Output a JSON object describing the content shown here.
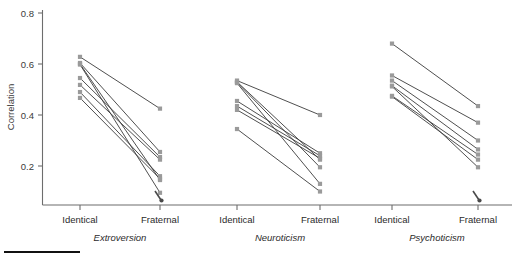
{
  "chart_data": {
    "type": "line",
    "title": "",
    "xlabel": "",
    "ylabel": "Correlation",
    "ylim": [
      0.0,
      0.8
    ],
    "yticks": [
      0.2,
      0.4,
      0.6,
      0.8
    ],
    "yticklabels": [
      "0.2",
      "0.4",
      "0.6",
      "0.8"
    ],
    "grid": false,
    "legend": "none",
    "x_categories": [
      "Identical",
      "Fraternal",
      "Identical",
      "Fraternal",
      "Identical",
      "Fraternal"
    ],
    "groups": [
      {
        "name": "Extroversion",
        "x": [
          "Identical",
          "Fraternal"
        ],
        "series": [
          {
            "name": "study-1",
            "values": [
              0.628,
              0.425
            ]
          },
          {
            "name": "study-2",
            "values": [
              0.604,
              0.255
            ]
          },
          {
            "name": "study-3",
            "values": [
              0.545,
              0.235
            ]
          },
          {
            "name": "study-4",
            "values": [
              0.518,
              0.225
            ]
          },
          {
            "name": "study-5",
            "values": [
              0.49,
              0.16
            ]
          },
          {
            "name": "study-6",
            "values": [
              0.467,
              0.15
            ]
          },
          {
            "name": "study-7",
            "values": [
              0.6,
              0.145
            ]
          },
          {
            "name": "study-8",
            "values": [
              0.598,
              0.095
            ]
          }
        ]
      },
      {
        "name": "Neuroticism",
        "x": [
          "Identical",
          "Fraternal"
        ],
        "series": [
          {
            "name": "study-1",
            "values": [
              0.535,
              0.4
            ]
          },
          {
            "name": "study-2",
            "values": [
              0.455,
              0.25
            ]
          },
          {
            "name": "study-3",
            "values": [
              0.435,
              0.24
            ]
          },
          {
            "name": "study-4",
            "values": [
              0.42,
              0.23
            ]
          },
          {
            "name": "study-5",
            "values": [
              0.53,
              0.225
            ]
          },
          {
            "name": "study-6",
            "values": [
              0.528,
              0.195
            ]
          },
          {
            "name": "study-7",
            "values": [
              0.525,
              0.13
            ]
          },
          {
            "name": "study-8",
            "values": [
              0.345,
              0.1
            ]
          }
        ]
      },
      {
        "name": "Psychoticism",
        "x": [
          "Identical",
          "Fraternal"
        ],
        "series": [
          {
            "name": "study-1",
            "values": [
              0.68,
              0.435
            ]
          },
          {
            "name": "study-2",
            "values": [
              0.555,
              0.37
            ]
          },
          {
            "name": "study-3",
            "values": [
              0.535,
              0.3
            ]
          },
          {
            "name": "study-4",
            "values": [
              0.515,
              0.265
            ]
          },
          {
            "name": "study-5",
            "values": [
              0.475,
              0.245
            ]
          },
          {
            "name": "study-6",
            "values": [
              0.472,
              0.225
            ]
          },
          {
            "name": "study-7",
            "values": [
              0.512,
              0.195
            ]
          }
        ]
      }
    ]
  },
  "axis": {
    "ylabel": "Correlation",
    "ytick_0": "0.2",
    "ytick_1": "0.4",
    "ytick_2": "0.6",
    "ytick_3": "0.8"
  },
  "categories": {
    "c0": "Identical",
    "c1": "Fraternal",
    "c2": "Identical",
    "c3": "Fraternal",
    "c4": "Identical",
    "c5": "Fraternal"
  },
  "group_labels": {
    "g0": "Extroversion",
    "g1": "Neuroticism",
    "g2": "Psychoticism"
  },
  "colors": {
    "marker": "#9a9a9a",
    "line": "#3b3b3b",
    "axis": "#6d6d6d",
    "text": "#2b2b2b",
    "background": "#ffffff"
  }
}
